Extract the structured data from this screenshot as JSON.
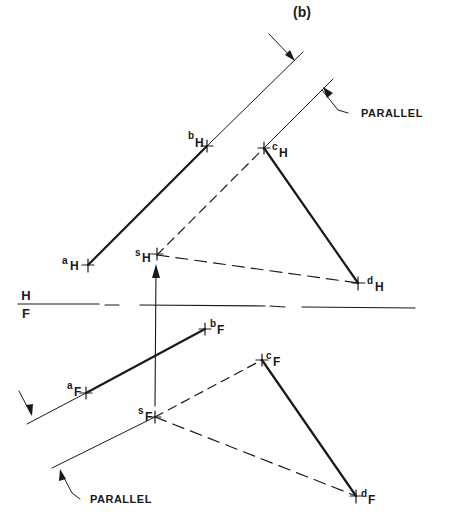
{
  "title": "(b)",
  "fold_line": {
    "upper": "H",
    "lower": "F"
  },
  "annotations": {
    "parallel_top": "PARALLEL",
    "parallel_bottom": "PARALLEL"
  },
  "points": {
    "aH": {
      "letter": "a",
      "view": "H"
    },
    "bH": {
      "letter": "b",
      "view": "H"
    },
    "cH": {
      "letter": "c",
      "view": "H"
    },
    "dH": {
      "letter": "d",
      "view": "H"
    },
    "sH": {
      "letter": "s",
      "view": "H"
    },
    "aF": {
      "letter": "a",
      "view": "F"
    },
    "bF": {
      "letter": "b",
      "view": "F"
    },
    "cF": {
      "letter": "c",
      "view": "F"
    },
    "dF": {
      "letter": "d",
      "view": "F"
    },
    "sF": {
      "letter": "s",
      "view": "F"
    }
  },
  "colors": {
    "ink": "#1a1a1a",
    "paper": "#ffffff"
  }
}
